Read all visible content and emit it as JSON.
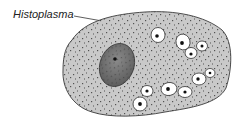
{
  "figure": {
    "label": "Histoplasma",
    "colors": {
      "cytoplasm": "#c9c9c9",
      "cell_outline": "#3a3a3a",
      "nucleus": "#707070",
      "organism_fill": "#ffffff",
      "organism_dot": "#111111",
      "stipple": "#2a2a2a",
      "label_text": "#222222"
    }
  }
}
